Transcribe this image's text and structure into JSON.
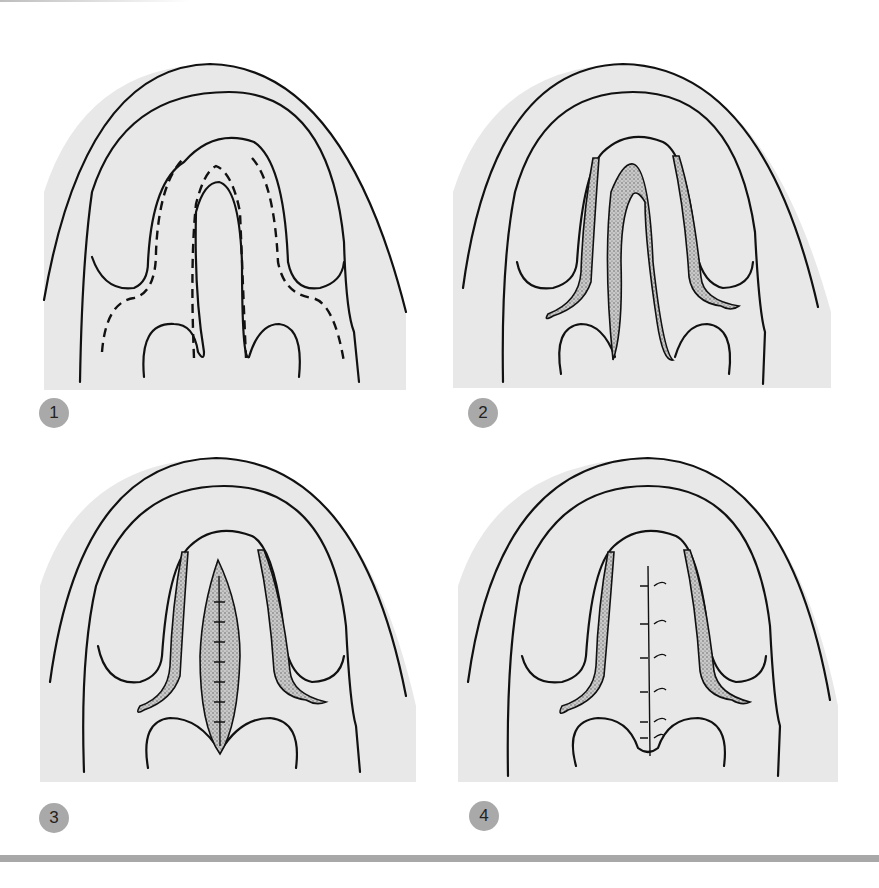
{
  "figure": {
    "panels": [
      {
        "label": "1",
        "description": "Incision lines (dashed) outlined on palate"
      },
      {
        "label": "2",
        "description": "Mucosa excised (stippled regions)"
      },
      {
        "label": "3",
        "description": "Midline defect closed, central raw area"
      },
      {
        "label": "4",
        "description": "Midline sutured closure"
      }
    ],
    "colors": {
      "panel_background": "#e8e8e8",
      "line": "#111111",
      "badge": "#a9a9a9",
      "rule": "#a8a8a8"
    }
  }
}
